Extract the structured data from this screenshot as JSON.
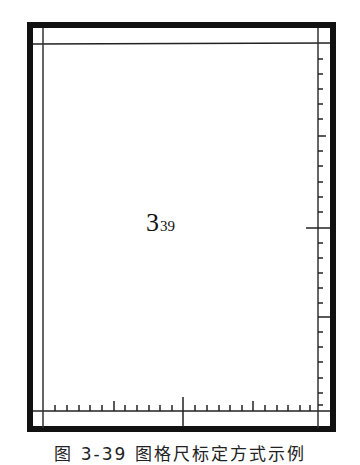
{
  "figure": {
    "label_main": "3",
    "label_sub": "39",
    "caption": "图 3-39 图格尺标定方式示例"
  },
  "colors": {
    "ink": "#111111",
    "background": "#ffffff"
  },
  "ruler": {
    "bottom_ticks_count": 22,
    "right_ticks_count": 22,
    "center_mark_x": 183,
    "right_major_mark_y": 228
  }
}
